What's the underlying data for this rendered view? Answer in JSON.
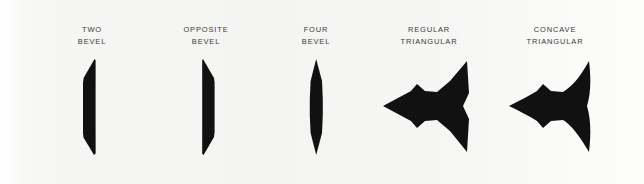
{
  "plate": {
    "background_color": "#f5f5f3",
    "ink_color": "#111111",
    "label_color": "#3a3a3a",
    "specimen_count": 5
  },
  "specimens": [
    {
      "id": "two-bevel",
      "label_line1": "TWO",
      "label_line2": "BEVEL",
      "shape": "blade-vertical-straight-right-edge"
    },
    {
      "id": "opposite-bevel",
      "label_line1": "OPPOSITE",
      "label_line2": "BEVEL",
      "shape": "blade-vertical-straight-left-edge"
    },
    {
      "id": "four-bevel",
      "label_line1": "FOUR",
      "label_line2": "BEVEL",
      "shape": "blade-double-pointed-spindle"
    },
    {
      "id": "regular-triangular",
      "label_line1": "REGULAR",
      "label_line2": "TRIANGULAR",
      "shape": "three-point-star-straight-flanks"
    },
    {
      "id": "concave-triangular",
      "label_line1": "CONCAVE",
      "label_line2": "TRIANGULAR",
      "shape": "three-point-star-concave-flanks"
    }
  ]
}
